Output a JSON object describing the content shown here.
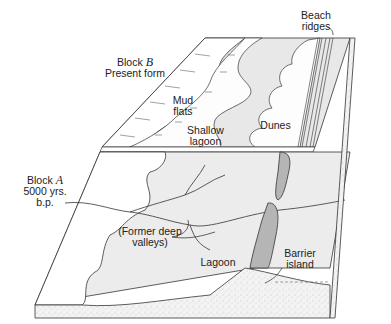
{
  "diagram": {
    "type": "block-diagram",
    "colors": {
      "ink": "#222222",
      "water": "#e6e6e6",
      "barrier": "#b5b5b5",
      "land": "#ffffff",
      "earth": "#f2f2f2"
    }
  },
  "labels": {
    "block_b_title": "Block",
    "block_b_letter": "B",
    "block_b_sub": "Present form",
    "block_a_title": "Block",
    "block_a_letter": "A",
    "block_a_sub1": "5000 yrs.",
    "block_a_sub2": "b.p.",
    "beach_ridges_1": "Beach",
    "beach_ridges_2": "ridges",
    "mud_flats_1": "Mud",
    "mud_flats_2": "flats",
    "shallow_lagoon_1": "Shallow",
    "shallow_lagoon_2": "lagoon",
    "dunes": "Dunes",
    "former_valleys_1": "(Former deep",
    "former_valleys_2": "valleys)",
    "lagoon": "Lagoon",
    "barrier_island_1": "Barrier",
    "barrier_island_2": "island"
  }
}
